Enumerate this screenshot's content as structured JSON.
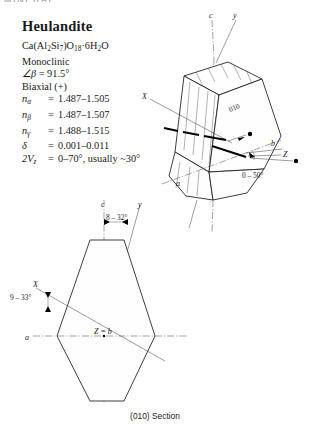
{
  "header": {
    "running_head": "MINERAL"
  },
  "title": "Heulandite",
  "properties": {
    "formula_parts": {
      "p1": "Ca(Al",
      "s1": "2",
      "p2": "Si",
      "s2": "7",
      "p3": ")O",
      "s3": "18",
      "p4": "·6H",
      "s4": "2",
      "p5": "O"
    },
    "system": "Monoclinic",
    "beta_symbol": "∠β",
    "beta_eq": "=",
    "beta_value": "91.5°",
    "optic_sign": "Biaxial (+)",
    "indices": [
      {
        "symbol": "n",
        "sub": "α",
        "eq": "=",
        "value": "1.487–1.505"
      },
      {
        "symbol": "n",
        "sub": "β",
        "eq": "=",
        "value": "1.487–1.507"
      },
      {
        "symbol": "n",
        "sub": "γ",
        "eq": "=",
        "value": "1.488–1.515"
      }
    ],
    "delta_symbol": "δ",
    "delta_eq": "=",
    "delta_value": "0.001–0.011",
    "twov_symbol": "2V",
    "twov_sub": "z",
    "twov_eq": "=",
    "twov_value": "0–70°, usually ~30°"
  },
  "crystal_3d": {
    "axis_c": "c",
    "axis_y": "y",
    "axis_x": "X",
    "axis_a": "a",
    "axis_b": "b",
    "axis_z": "Z",
    "face_label": "010",
    "extinction_angle": "0 – 50°"
  },
  "section_2d": {
    "axis_c": "c",
    "axis_y": "y",
    "axis_x": "X",
    "axis_a": "a",
    "center_label": "Z = b",
    "angle_top": "8 – 32°",
    "angle_left": "9 – 33°"
  },
  "caption": "(010) Section",
  "colors": {
    "ink": "#1a1a1a",
    "line": "#1b1b1b",
    "paper": "#ffffff",
    "guide": "#555555"
  }
}
